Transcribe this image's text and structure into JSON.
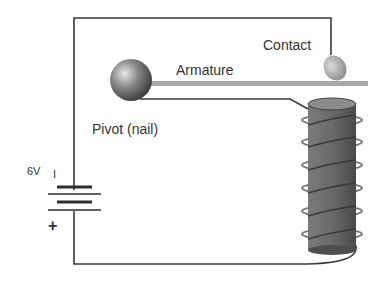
{
  "diagram": {
    "labels": {
      "contact": "Contact",
      "armature": "Armature",
      "pivot": "Pivot (nail)",
      "voltage": "6V",
      "minus": "I",
      "plus": "+"
    },
    "components": [
      "battery",
      "pivot",
      "armature",
      "contact",
      "electromagnet-coil",
      "wire"
    ],
    "colors": {
      "wire": "#3a3a3a",
      "armature": "#a8a8a8",
      "coil_core": "#6a6a6a",
      "ball": "#707070"
    }
  }
}
